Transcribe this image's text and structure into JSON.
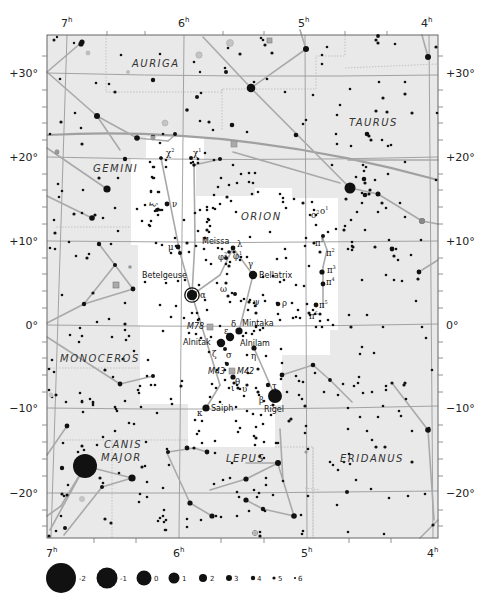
{
  "map": {
    "title": "Orion constellation star chart",
    "colors": {
      "sky_background": "#e9e9e9",
      "constellation_area": "#ffffff",
      "grid_line": "#9a9a9a",
      "constellation_line": "#a9a9a9",
      "ecliptic": "#a0a0a0",
      "boundary": "#b8b8b8",
      "star": "#111111",
      "nebula": "#9a9a9a",
      "frame": "#666666"
    },
    "ra_labels": [
      {
        "hours": "7",
        "sup": "h"
      },
      {
        "hours": "6",
        "sup": "h"
      },
      {
        "hours": "5",
        "sup": "h"
      },
      {
        "hours": "4",
        "sup": "h"
      }
    ],
    "dec_labels": [
      "+30°",
      "+20°",
      "+10°",
      "0°",
      "−10°",
      "−20°"
    ],
    "constellations": [
      {
        "name": "AURIGA"
      },
      {
        "name": "TAURUS"
      },
      {
        "name": "GEMINI"
      },
      {
        "name": "ORION"
      },
      {
        "name": "MONOCEROS"
      },
      {
        "name": "CANIS"
      },
      {
        "name": "MAJOR"
      },
      {
        "name": "LEPUS"
      },
      {
        "name": "ERIDANUS"
      }
    ],
    "named_stars": [
      {
        "name": "Betelgeuse"
      },
      {
        "name": "Bellatrix"
      },
      {
        "name": "Meissa"
      },
      {
        "name": "Mintaka"
      },
      {
        "name": "Alnitak"
      },
      {
        "name": "Alnilam"
      },
      {
        "name": "Saiph"
      },
      {
        "name": "Rigel"
      }
    ],
    "deep_sky_objects": [
      {
        "name": "M78"
      },
      {
        "name": "M43"
      },
      {
        "name": "M42"
      }
    ],
    "greek_labels": {
      "chi2": "χ",
      "chi2_sup": "2",
      "chi1": "χ",
      "chi1_sup": "1",
      "xi": "ξ",
      "nu": "ν",
      "mu": "μ",
      "alpha": "α",
      "lambda": "λ",
      "phi2": "φ",
      "phi2_sup": "2",
      "phi1": "φ",
      "phi1_sup": "1",
      "gamma": "γ",
      "omicron2": "ο",
      "omicron2_sup": "2",
      "omicron1": "ο",
      "omicron1_sup": "1",
      "pi1": "π",
      "pi1_sup": "1",
      "pi2": "π",
      "pi2_sup": "2",
      "pi3": "π",
      "pi3_sup": "3",
      "pi4": "π",
      "pi4_sup": "4",
      "pi5": "π",
      "pi5_sup": "5",
      "pi6": "π",
      "pi6_sup": "6",
      "omega": "ω",
      "psi": "ψ",
      "rho": "ρ",
      "delta": "δ",
      "epsilon": "ε",
      "zeta": "ζ",
      "sigma": "σ",
      "eta": "η",
      "theta": "θ",
      "iota": "ι",
      "upsilon": "υ",
      "tau": "τ",
      "beta": "β",
      "kappa": "κ"
    },
    "magnitude_legend": [
      {
        "mag": "-2",
        "r": 15
      },
      {
        "mag": "-1",
        "r": 10.5
      },
      {
        "mag": "0",
        "r": 7.5
      },
      {
        "mag": "1",
        "r": 5.5
      },
      {
        "mag": "2",
        "r": 4
      },
      {
        "mag": "3",
        "r": 3
      },
      {
        "mag": "4",
        "r": 2.2
      },
      {
        "mag": "5",
        "r": 1.6
      },
      {
        "mag": "6",
        "r": 1.1
      }
    ]
  }
}
